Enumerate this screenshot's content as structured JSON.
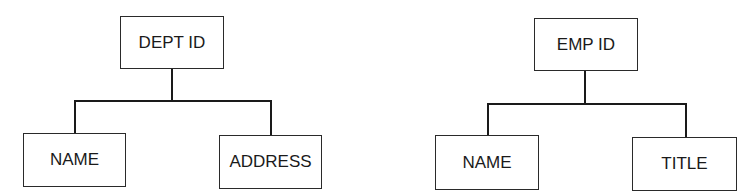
{
  "diagram": {
    "type": "hierarchy-tree",
    "colors": {
      "line": "#1a1a1a",
      "box_border": "#2a2a2a",
      "text": "#1a1a1a",
      "background": "#ffffff"
    },
    "trees": [
      {
        "root": {
          "label": "DEPT ID"
        },
        "children": [
          {
            "label": "NAME"
          },
          {
            "label": "ADDRESS"
          }
        ]
      },
      {
        "root": {
          "label": "EMP ID"
        },
        "children": [
          {
            "label": "NAME"
          },
          {
            "label": "TITLE"
          }
        ]
      }
    ]
  }
}
